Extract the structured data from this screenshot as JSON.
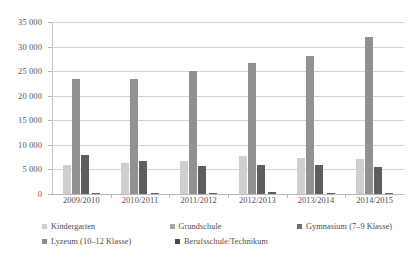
{
  "chart_data": {
    "type": "bar",
    "title": "",
    "xlabel": "",
    "ylabel": "",
    "ylim": [
      0,
      35000
    ],
    "grid": true,
    "legend_position": "bottom",
    "categories": [
      "2009/2010",
      "2010/2011",
      "2011/2012",
      "2012/2013",
      "2013/2014",
      "2014/2015"
    ],
    "ytick_labels": [
      "35 000",
      "30 000",
      "25 000",
      "20 000",
      "15 000",
      "10 000",
      "5 000",
      "0"
    ],
    "ytick_values": [
      35000,
      30000,
      25000,
      20000,
      15000,
      10000,
      5000,
      0
    ],
    "series": [
      {
        "name": "Kindergarten",
        "color": "#cfcfcf",
        "values": [
          6000,
          6400,
          6800,
          7700,
          7400,
          7100
        ]
      },
      {
        "name": "Grundschule",
        "color": "#a6a6a6",
        "values": [
          0,
          0,
          0,
          0,
          0,
          0
        ]
      },
      {
        "name": "Gymnasium (7–9 Klasse)",
        "color": "#919191",
        "values": [
          23500,
          23400,
          25000,
          26700,
          28000,
          32000
        ]
      },
      {
        "name": "Lyzeum (10–12 Klasse)",
        "color": "#b0b0b0",
        "values": [
          0,
          0,
          0,
          0,
          0,
          0
        ]
      },
      {
        "name": "Berufsschule/Technikum",
        "color": "#5e5e5e",
        "values": [
          8000,
          6800,
          5600,
          6000,
          5900,
          5400
        ]
      }
    ],
    "minor_series_values": [
      150,
      150,
      250,
      400,
      250,
      250
    ]
  },
  "legend": {
    "rows": [
      [
        {
          "label": "Kindergarten",
          "swatch": "s0"
        },
        {
          "label": "Grundschule",
          "swatch": "s1"
        },
        {
          "label": "Gymnasium (7–9 Klasse)",
          "swatch": "s2"
        }
      ],
      [
        {
          "label": "Lyzeum (10–12 Klasse)",
          "swatch": "s3"
        },
        {
          "label": "Berufsschule/Technikum",
          "swatch": "s4"
        }
      ]
    ]
  }
}
